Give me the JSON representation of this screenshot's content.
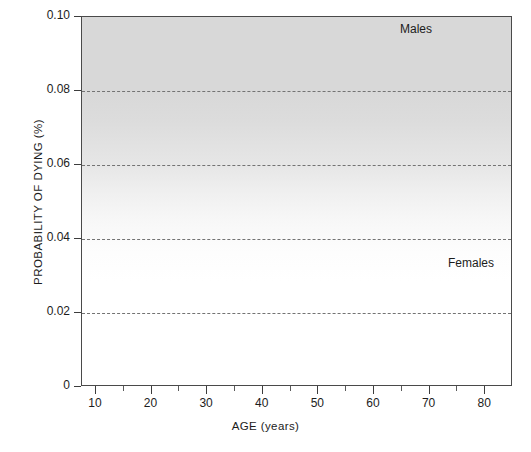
{
  "chart_data": {
    "type": "line",
    "title": "",
    "xlabel": "AGE (years)",
    "ylabel": "PROBABILITY OF DYING (%)",
    "xlim": [
      7.5,
      85
    ],
    "ylim": [
      0,
      0.1
    ],
    "grid": "horizontal dashed gridlines at 0.02, 0.04, 0.06, 0.08",
    "legend_position": "inline labels at end of each curve",
    "x_ticks": [
      10,
      20,
      30,
      40,
      50,
      60,
      70,
      80
    ],
    "x_tick_labels": [
      "10",
      "20",
      "30",
      "40",
      "50",
      "60",
      "70",
      "80"
    ],
    "x_minor_ticks": [
      15,
      25,
      35,
      45,
      55,
      65,
      75
    ],
    "y_ticks": [
      0,
      0.02,
      0.04,
      0.06,
      0.08,
      0.1
    ],
    "y_tick_labels": [
      "0",
      "0.02",
      "0.04",
      "0.06",
      "0.08",
      "0.10"
    ],
    "x": [
      10,
      15,
      20,
      25,
      30,
      35,
      40,
      45,
      50,
      55,
      60,
      65,
      70,
      75,
      80
    ],
    "series": [
      {
        "name": "Males",
        "color": "#6b6b6b",
        "values": [
          0.0003,
          0.001,
          0.0017,
          0.0017,
          0.0017,
          0.0017,
          0.0025,
          0.004,
          0.006,
          0.0095,
          0.0155,
          0.0245,
          0.036,
          0.064,
          0.0955
        ]
      },
      {
        "name": "Females",
        "color": "#1a1a1a",
        "values": [
          0.0002,
          0.0006,
          0.0009,
          0.0009,
          0.0009,
          0.0009,
          0.0014,
          0.0022,
          0.0022,
          0.0043,
          0.0068,
          0.01,
          0.014,
          0.025,
          0.0385
        ]
      }
    ],
    "annotations": [
      {
        "text": "Males",
        "x": 76,
        "y": 0.0955
      },
      {
        "text": "Females",
        "x": 81,
        "y": 0.044
      }
    ]
  },
  "labels": {
    "y_axis_title": "PROBABILITY OF DYING (%)",
    "x_axis_title": "AGE (years)",
    "series_males": "Males",
    "series_females": "Females",
    "footnote": ""
  },
  "colors": {
    "males_line": "#6b6b6b",
    "females_line": "#1a1a1a",
    "gridline": "#737373",
    "axis": "#4a4a4a",
    "background_top": "#d8d8d8",
    "background_bottom": "#ffffff"
  }
}
